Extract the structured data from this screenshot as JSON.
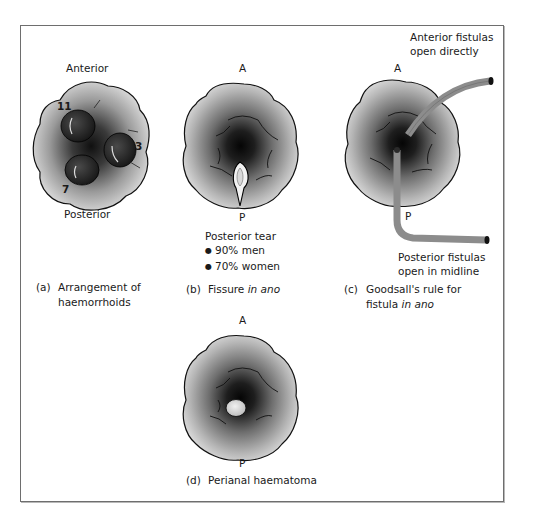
{
  "figure": {
    "panels": [
      {
        "id": "a",
        "top_label": "Anterior",
        "bottom_label": "Posterior",
        "position_numbers": [
          "11",
          "3",
          "7"
        ],
        "caption_tag": "(a)",
        "caption_line1": "Arrangement of",
        "caption_line2": "haemorrhoids"
      },
      {
        "id": "b",
        "top_label": "A",
        "bottom_label": "P",
        "note_title": "Posterior tear",
        "note_items": [
          "90% men",
          "70% women"
        ],
        "caption_tag": "(b)",
        "caption_text": "Fissure ",
        "caption_italic": "in ano"
      },
      {
        "id": "c",
        "top_label": "A",
        "bottom_label": "P",
        "anterior_note_line1": "Anterior fistulas",
        "anterior_note_line2": "open directly",
        "posterior_note_line1": "Posterior fistulas",
        "posterior_note_line2": "open in midline",
        "caption_tag": "(c)",
        "caption_line1": "Goodsall's rule for",
        "caption_line2_text": "fistula ",
        "caption_line2_italic": "in ano"
      },
      {
        "id": "d",
        "top_label": "A",
        "bottom_label": "P",
        "caption_tag": "(d)",
        "caption_text": "Perianal haematoma"
      }
    ],
    "colors": {
      "frame_border": "#6e6e6e",
      "tissue_light": "#d9d9d9",
      "tissue_dark": "#0d0d0d",
      "fistula_track": "#8c8c8c",
      "outline": "#111111"
    }
  }
}
